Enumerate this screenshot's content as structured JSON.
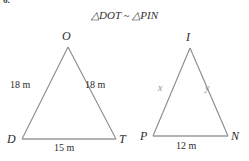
{
  "problem": {
    "number": "6."
  },
  "statement": {
    "triangle_symbol": "△",
    "first_triangle": "DOT",
    "relation_symbol": "~",
    "second_triangle": "PIN",
    "full_text": "△DOT ~ △PIN"
  },
  "colors": {
    "stroke": "#8a8a8a",
    "base_stroke": "#9a9a9a",
    "text": "#2b2b2b",
    "variable_text": "#8f8f8f",
    "background": "#ffffff"
  },
  "figures": [
    {
      "name": "triangle-dot",
      "vertices": [
        {
          "label": "O",
          "role": "apex",
          "x": 68,
          "y": 47
        },
        {
          "label": "D",
          "role": "bottom-left",
          "x": 22,
          "y": 139
        },
        {
          "label": "T",
          "role": "bottom-right",
          "x": 116,
          "y": 139
        }
      ],
      "sides": [
        {
          "name": "left-leg",
          "label": "18 m",
          "value": 18,
          "unit": "m"
        },
        {
          "name": "right-leg",
          "label": "18 m",
          "value": 18,
          "unit": "m"
        },
        {
          "name": "base",
          "label": "15 m",
          "value": 15,
          "unit": "m"
        }
      ]
    },
    {
      "name": "triangle-pin",
      "vertices": [
        {
          "label": "I",
          "role": "apex",
          "x": 190,
          "y": 48
        },
        {
          "label": "P",
          "role": "bottom-left",
          "x": 153,
          "y": 136
        },
        {
          "label": "N",
          "role": "bottom-right",
          "x": 228,
          "y": 136
        }
      ],
      "sides": [
        {
          "name": "left-leg",
          "label": "x",
          "value": null,
          "unit": "m"
        },
        {
          "name": "right-leg",
          "label": "y",
          "value": null,
          "unit": "m"
        },
        {
          "name": "base",
          "label": "12 m",
          "value": 12,
          "unit": "m"
        }
      ]
    }
  ],
  "labels": {
    "dot_apex": "O",
    "dot_bottom_left": "D",
    "dot_bottom_right": "T",
    "dot_left_side": "18 m",
    "dot_right_side": "18 m",
    "dot_base": "15 m",
    "pin_apex": "I",
    "pin_bottom_left": "P",
    "pin_bottom_right": "N",
    "pin_left_side": "x",
    "pin_right_side": "y",
    "pin_base": "12 m"
  }
}
